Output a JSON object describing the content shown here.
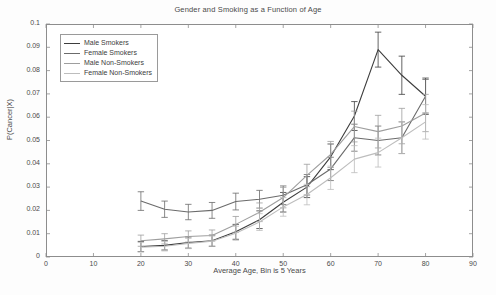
{
  "chart_data": {
    "type": "line",
    "title": "Gender and Smoking as a Function of Age",
    "xlabel": "Average Age, Bin is 5 Years",
    "ylabel": "P(Cancer|X)",
    "xlim": [
      0,
      90
    ],
    "ylim": [
      0,
      0.1
    ],
    "xticks": [
      0,
      10,
      20,
      30,
      40,
      50,
      60,
      70,
      80,
      90
    ],
    "xtick_labels": [
      "0",
      "10",
      "20",
      "30",
      "40",
      "50",
      "60",
      "70",
      "80",
      "90"
    ],
    "yticks": [
      0,
      0.01,
      0.02,
      0.03,
      0.04,
      0.05,
      0.06,
      0.07,
      0.08,
      0.09,
      0.1
    ],
    "ytick_labels": [
      "0",
      "0.01",
      "0.02",
      "0.03",
      "0.04",
      "0.05",
      "0.06",
      "0.07",
      "0.08",
      "0.09",
      "0.1"
    ],
    "grid": false,
    "legend_position": "upper left",
    "errorbars": true,
    "x": [
      20,
      25,
      30,
      35,
      40,
      45,
      50,
      55,
      60,
      65,
      70,
      75,
      80
    ],
    "series": [
      {
        "name": "Male Smokers",
        "color": "#3d3d3d",
        "values": [
          0.0045,
          0.005,
          0.0062,
          0.007,
          0.0108,
          0.016,
          0.0235,
          0.03,
          0.043,
          0.0605,
          0.089,
          0.078,
          0.069
        ],
        "errors": [
          0.0022,
          0.002,
          0.0024,
          0.0024,
          0.0032,
          0.0038,
          0.0042,
          0.0045,
          0.0055,
          0.0062,
          0.0075,
          0.0082,
          0.0078
        ]
      },
      {
        "name": "Female Smokers",
        "color": "#6b6b6b",
        "values": [
          0.024,
          0.0205,
          0.0193,
          0.02,
          0.0238,
          0.0248,
          0.0265,
          0.031,
          0.0378,
          0.0512,
          0.05,
          0.0512,
          0.069
        ],
        "errors": [
          0.004,
          0.0035,
          0.0033,
          0.0034,
          0.0036,
          0.0038,
          0.004,
          0.0044,
          0.005,
          0.0058,
          0.0062,
          0.0068,
          0.0072
        ]
      },
      {
        "name": "Male Non-Smokers",
        "color": "#9e9e9e",
        "values": [
          0.007,
          0.0078,
          0.0088,
          0.0092,
          0.014,
          0.0192,
          0.0255,
          0.035,
          0.044,
          0.056,
          0.0538,
          0.0562,
          0.0618
        ],
        "errors": [
          0.0024,
          0.0022,
          0.0024,
          0.0024,
          0.0034,
          0.004,
          0.0044,
          0.0048,
          0.0056,
          0.0066,
          0.007,
          0.0076,
          0.008
        ]
      },
      {
        "name": "Female Non-Smokers",
        "color": "#bdbdbd",
        "values": [
          0.0042,
          0.0046,
          0.0058,
          0.0068,
          0.0102,
          0.015,
          0.0215,
          0.0268,
          0.034,
          0.042,
          0.0448,
          0.0512,
          0.058
        ],
        "errors": [
          0.002,
          0.002,
          0.0022,
          0.0022,
          0.003,
          0.0036,
          0.004,
          0.0044,
          0.005,
          0.0058,
          0.0062,
          0.0068,
          0.0074
        ]
      }
    ]
  }
}
